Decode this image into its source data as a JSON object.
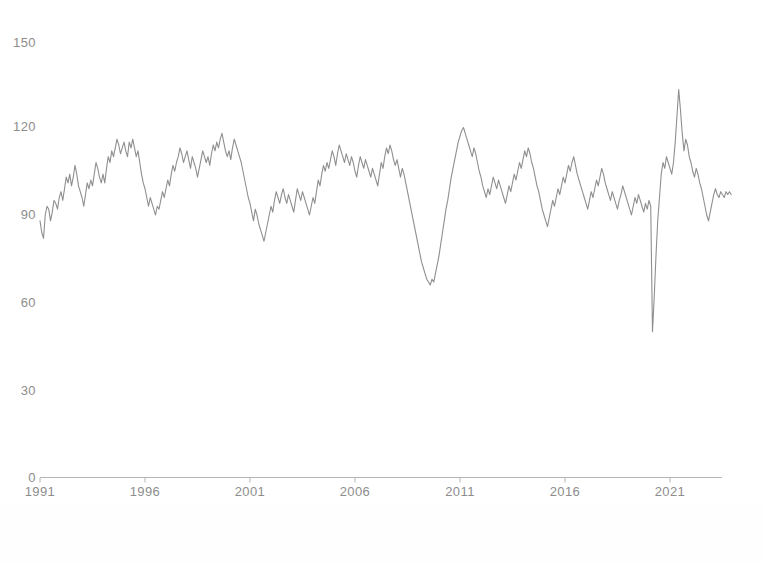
{
  "chart_data": {
    "type": "line",
    "title": "",
    "subtitle": "",
    "xlabel": "",
    "ylabel": "",
    "xlim": [
      1991.0,
      2023.5
    ],
    "ylim": [
      0,
      150
    ],
    "grid": false,
    "legend": null,
    "x_ticks": [
      "1991",
      "1996",
      "2001",
      "2006",
      "2011",
      "2016",
      "2021"
    ],
    "x_tick_values": [
      1991,
      1996,
      2001,
      2006,
      2011,
      2016,
      2021
    ],
    "y_ticks": [
      "0",
      "30",
      "60",
      "90",
      "120",
      "150"
    ],
    "y_tick_values": [
      0,
      30,
      60,
      90,
      120,
      150
    ],
    "line_color": "#8f8f8f",
    "axis_color": "#b0b0b0",
    "text_color": "#8d8d8d",
    "background_color": "#ffffff",
    "series": [
      {
        "name": "index",
        "x_start": 1991.0,
        "x_step": 0.08333,
        "values": [
          88,
          84,
          82,
          90,
          93,
          92,
          88,
          91,
          95,
          94,
          92,
          96,
          98,
          95,
          99,
          103,
          101,
          104,
          100,
          103,
          107,
          104,
          100,
          98,
          96,
          93,
          97,
          101,
          99,
          102,
          100,
          104,
          108,
          106,
          103,
          101,
          104,
          101,
          106,
          110,
          108,
          112,
          110,
          113,
          116,
          114,
          111,
          113,
          115,
          112,
          110,
          115,
          113,
          116,
          113,
          110,
          112,
          108,
          104,
          101,
          99,
          96,
          93,
          96,
          94,
          92,
          90,
          93,
          92,
          95,
          98,
          96,
          99,
          102,
          100,
          104,
          107,
          105,
          108,
          110,
          113,
          111,
          108,
          110,
          112,
          109,
          106,
          110,
          108,
          106,
          103,
          106,
          109,
          112,
          110,
          108,
          110,
          107,
          111,
          114,
          112,
          115,
          113,
          116,
          118,
          115,
          112,
          110,
          112,
          109,
          113,
          116,
          114,
          112,
          110,
          108,
          105,
          102,
          99,
          96,
          94,
          91,
          88,
          92,
          90,
          87,
          85,
          83,
          81,
          84,
          87,
          90,
          93,
          91,
          95,
          98,
          96,
          94,
          97,
          99,
          96,
          94,
          97,
          95,
          93,
          91,
          95,
          99,
          97,
          95,
          98,
          96,
          94,
          92,
          90,
          93,
          96,
          94,
          98,
          102,
          100,
          104,
          107,
          105,
          108,
          106,
          109,
          112,
          110,
          107,
          111,
          114,
          112,
          110,
          108,
          111,
          109,
          107,
          110,
          108,
          105,
          103,
          107,
          110,
          108,
          106,
          109,
          107,
          105,
          103,
          106,
          104,
          102,
          100,
          104,
          108,
          106,
          110,
          113,
          111,
          114,
          112,
          109,
          107,
          109,
          106,
          103,
          106,
          104,
          101,
          98,
          95,
          92,
          89,
          86,
          83,
          80,
          77,
          74,
          72,
          70,
          68,
          67,
          66,
          68,
          67,
          70,
          73,
          76,
          80,
          84,
          88,
          92,
          95,
          99,
          103,
          106,
          109,
          112,
          115,
          117,
          119,
          120,
          118,
          116,
          114,
          112,
          110,
          113,
          111,
          108,
          105,
          103,
          100,
          98,
          96,
          99,
          97,
          100,
          103,
          101,
          99,
          102,
          100,
          98,
          96,
          94,
          97,
          100,
          98,
          101,
          104,
          102,
          105,
          108,
          106,
          109,
          112,
          110,
          113,
          111,
          108,
          106,
          103,
          100,
          98,
          95,
          92,
          90,
          88,
          86,
          89,
          92,
          95,
          93,
          96,
          99,
          97,
          100,
          103,
          101,
          104,
          107,
          105,
          108,
          110,
          107,
          104,
          102,
          100,
          98,
          96,
          94,
          92,
          95,
          98,
          96,
          99,
          102,
          100,
          103,
          106,
          104,
          101,
          99,
          97,
          95,
          98,
          96,
          94,
          92,
          95,
          97,
          100,
          98,
          96,
          94,
          92,
          90,
          93,
          96,
          94,
          97,
          95,
          93,
          91,
          94,
          92,
          95,
          93,
          50,
          62,
          76,
          88,
          96,
          104,
          108,
          106,
          110,
          108,
          106,
          104,
          108,
          115,
          124,
          133,
          126,
          118,
          112,
          116,
          114,
          110,
          108,
          105,
          103,
          106,
          104,
          101,
          99,
          96,
          93,
          90,
          88,
          91,
          94,
          97,
          99,
          97,
          96,
          98,
          97,
          96,
          98,
          97,
          98,
          97
        ]
      }
    ],
    "annotations": [
      {
        "label": "2001 slowdown trough",
        "x": 2001.5,
        "y": 81
      },
      {
        "label": "2009 recession trough",
        "x": 2009.5,
        "y": 66
      },
      {
        "label": "COVID-19 crash",
        "x": 2020.25,
        "y": 50
      },
      {
        "label": "2021 recovery peak",
        "x": 2021.5,
        "y": 133
      }
    ]
  },
  "axes": {
    "y_labels": [
      {
        "text": "150",
        "top": 36
      },
      {
        "text": "120",
        "top": 120
      },
      {
        "text": "90",
        "top": 208
      },
      {
        "text": "60",
        "top": 296
      },
      {
        "text": "30",
        "top": 384
      },
      {
        "text": "0",
        "top": 471
      }
    ],
    "x_labels": [
      {
        "text": "1991",
        "left": 10
      },
      {
        "text": "1996",
        "left": 115
      },
      {
        "text": "2001",
        "left": 220
      },
      {
        "text": "2006",
        "left": 325
      },
      {
        "text": "2011",
        "left": 430
      },
      {
        "text": "2016",
        "left": 535
      },
      {
        "text": "2021",
        "left": 640
      }
    ]
  }
}
